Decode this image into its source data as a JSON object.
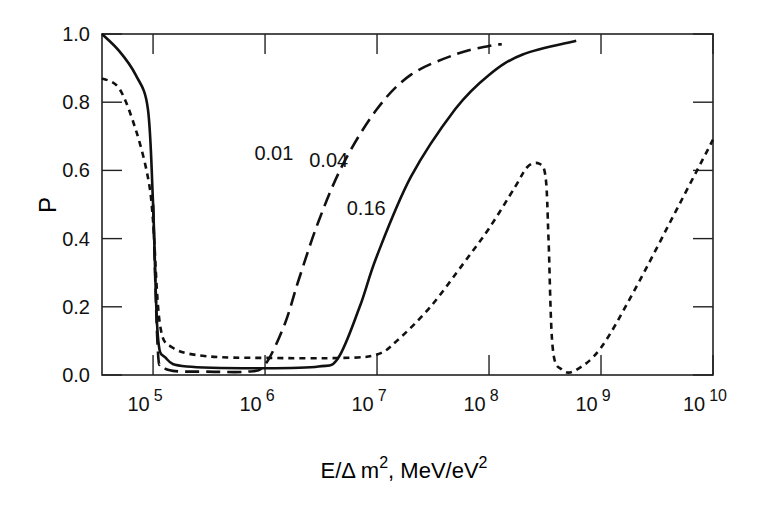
{
  "chart_data": {
    "type": "line",
    "title": "",
    "xlabel": "E/Δ m², MeV/eV²",
    "xlabel_parts": {
      "main": "E/Δ m",
      "sup1": "2",
      "mid": ", MeV/eV",
      "sup2": "2"
    },
    "ylabel": "P",
    "xscale": "log",
    "xlim": [
      35000,
      10000000000
    ],
    "ylim": [
      0,
      1.0
    ],
    "grid": false,
    "legend": "inline labels",
    "x_ticks": [
      {
        "base": "10",
        "exp": "5",
        "value": 100000
      },
      {
        "base": "10",
        "exp": "6",
        "value": 1000000
      },
      {
        "base": "10",
        "exp": "7",
        "value": 10000000
      },
      {
        "base": "10",
        "exp": "8",
        "value": 100000000
      },
      {
        "base": "10",
        "exp": "9",
        "value": 1000000000
      },
      {
        "base": "10",
        "exp": "10",
        "value": 10000000000
      }
    ],
    "y_ticks": [
      "0.0",
      "0.2",
      "0.4",
      "0.6",
      "0.8",
      "1.0"
    ],
    "series": [
      {
        "name": "0.01",
        "style": "long-dash",
        "x": [
          100000.0,
          110000.0,
          120000.0,
          150000.0,
          300000.0,
          700000.0,
          1000000.0,
          1500000.0,
          2000000.0,
          3000000.0,
          5000000.0,
          10000000.0,
          20000000.0,
          50000000.0,
          100000000.0,
          130000000.0
        ],
        "y": [
          0.5,
          0.08,
          0.03,
          0.012,
          0.01,
          0.01,
          0.03,
          0.15,
          0.28,
          0.45,
          0.62,
          0.78,
          0.88,
          0.94,
          0.965,
          0.97
        ]
      },
      {
        "name": "0.04",
        "style": "solid",
        "x": [
          35000.0,
          50000.0,
          70000.0,
          90000.0,
          100000.0,
          110000.0,
          130000.0,
          200000.0,
          1000000.0,
          3000000.0,
          4500000.0,
          7000000.0,
          10000000.0,
          20000000.0,
          50000000.0,
          100000000.0,
          200000000.0,
          600000000.0
        ],
        "y": [
          1.0,
          0.95,
          0.88,
          0.78,
          0.5,
          0.12,
          0.05,
          0.025,
          0.02,
          0.025,
          0.05,
          0.2,
          0.35,
          0.58,
          0.78,
          0.88,
          0.94,
          0.98
        ]
      },
      {
        "name": "0.16",
        "style": "short-dash",
        "x": [
          35000.0,
          50000.0,
          70000.0,
          90000.0,
          100000.0,
          115000.0,
          150000.0,
          300000.0,
          1000000.0,
          5000000.0,
          10000000.0,
          15000000.0,
          30000000.0,
          60000000.0,
          100000000.0,
          170000000.0,
          220000000.0,
          280000000.0,
          320000000.0,
          340000000.0,
          370000000.0,
          450000000.0,
          600000000.0,
          1000000000.0,
          2000000000.0,
          5000000000.0,
          10000000000.0
        ],
        "y": [
          0.87,
          0.84,
          0.72,
          0.58,
          0.45,
          0.15,
          0.08,
          0.055,
          0.05,
          0.05,
          0.06,
          0.1,
          0.2,
          0.33,
          0.43,
          0.55,
          0.61,
          0.62,
          0.58,
          0.4,
          0.08,
          0.015,
          0.015,
          0.08,
          0.25,
          0.5,
          0.69
        ]
      }
    ],
    "annotations": [
      {
        "text": "0.01",
        "x": 1200000.0,
        "y": 0.63
      },
      {
        "text": "0.04",
        "x": 3700000.0,
        "y": 0.61
      },
      {
        "text": "0.16",
        "x": 8000000.0,
        "y": 0.47
      }
    ]
  }
}
